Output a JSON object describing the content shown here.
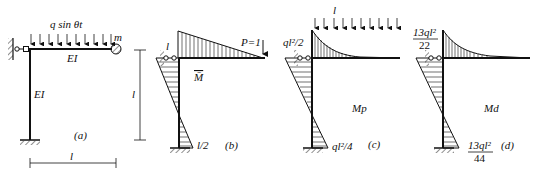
{
  "figure": {
    "panels": [
      {
        "id": "a",
        "caption": "(a)",
        "load_label": "q sin θt",
        "mass_label": "m",
        "beam_label": "EI",
        "column_label": "EI",
        "span_label": "l"
      },
      {
        "id": "b",
        "caption": "(b)",
        "load_label": "P=1",
        "top_value_label": "l",
        "bottom_value_label": "l/2",
        "diagram_label": "M̄",
        "height_label": "l"
      },
      {
        "id": "c",
        "caption": "(c)",
        "load_label": "l",
        "top_value_label": "ql²/2",
        "bottom_value_label": "ql²/4",
        "diagram_label": "Mp"
      },
      {
        "id": "d",
        "caption": "(d)",
        "top_value_num": "13ql²",
        "top_value_den": "22",
        "bottom_value_num": "13ql²",
        "bottom_value_den": "44",
        "diagram_label": "Md"
      }
    ]
  }
}
